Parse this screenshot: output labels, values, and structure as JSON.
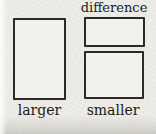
{
  "figure": {
    "kind": "comparison-bar-model",
    "labels": {
      "difference": "difference",
      "larger": "larger",
      "smaller": "smaller"
    },
    "bars": [
      {
        "id": "larger",
        "label": "larger",
        "relative_size": "large"
      },
      {
        "id": "difference",
        "label": "difference",
        "relative_size": "small"
      },
      {
        "id": "smaller",
        "label": "smaller",
        "relative_size": "medium"
      }
    ],
    "colors": {
      "paper": "#efeee9",
      "line": "#2b2a28",
      "text": "#1c1b19"
    }
  }
}
